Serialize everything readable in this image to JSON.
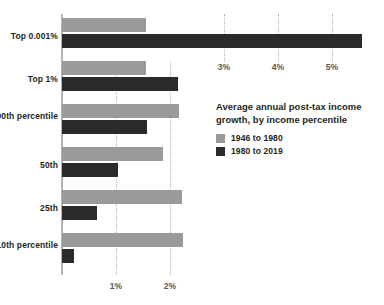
{
  "chart_data": {
    "type": "bar",
    "orientation": "horizontal",
    "title": "Average annual post-tax income growth, by income percentile",
    "xlabel": "",
    "ylabel": "",
    "categories": [
      "Top 0.001%",
      "Top 1%",
      "90th percentile",
      "50th",
      "25th",
      "10th percentile"
    ],
    "series": [
      {
        "name": "1946 to 1980",
        "color": "#9a9a9a",
        "values": [
          1.55,
          1.55,
          2.17,
          1.87,
          2.22,
          2.24
        ]
      },
      {
        "name": "1980 to 2019",
        "color": "#2b2b2b",
        "values": [
          5.55,
          2.15,
          1.57,
          1.04,
          0.64,
          0.22
        ]
      }
    ],
    "xlim": [
      0,
      5.95
    ],
    "xticks": [
      {
        "value": 1,
        "label": "1%",
        "position": "bottom"
      },
      {
        "value": 2,
        "label": "2%",
        "position": "bottom"
      },
      {
        "value": 3,
        "label": "3%",
        "position": "top"
      },
      {
        "value": 4,
        "label": "4%",
        "position": "top"
      },
      {
        "value": 5,
        "label": "5%",
        "position": "top"
      }
    ],
    "grid": true,
    "legend_position": "center-right",
    "units": "percent"
  },
  "legend": {
    "title": "Average annual post-tax income growth, by income percentile",
    "items": [
      {
        "label": "1946 to 1980",
        "color": "#9a9a9a"
      },
      {
        "label": "1980 to 2019",
        "color": "#2b2b2b"
      }
    ]
  },
  "axis": {
    "top_ticks": [
      "3%",
      "4%",
      "5%"
    ],
    "bottom_ticks": [
      "1%",
      "2%"
    ]
  },
  "categories": [
    {
      "label": "Top 0.001%"
    },
    {
      "label": "Top 1%"
    },
    {
      "label": "90th percentile"
    },
    {
      "label": "50th"
    },
    {
      "label": "25th"
    },
    {
      "label": "10th percentile"
    }
  ]
}
